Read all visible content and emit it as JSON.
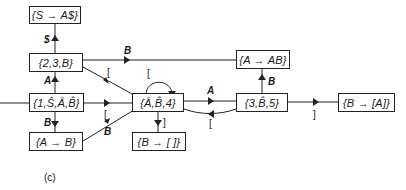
{
  "diagram": {
    "caption": "(c)",
    "nodes": [
      {
        "id": "n_top",
        "label": "{S → A$}"
      },
      {
        "id": "n_23b",
        "label": "{2,3,B}"
      },
      {
        "id": "n_start",
        "label": "{1,Ŝ,Â,B̂}"
      },
      {
        "id": "n_ab_left",
        "label": "{A → B}"
      },
      {
        "id": "n_a4",
        "label": "{Â,B̂,4}"
      },
      {
        "id": "n_b_empty",
        "label": "{B → [ ]}"
      },
      {
        "id": "n_aab",
        "label": "{A → AB}"
      },
      {
        "id": "n_3b5",
        "label": "{3,B̂,5}"
      },
      {
        "id": "n_ba",
        "label": "{B → [A]}"
      }
    ],
    "edges": [
      {
        "from": "n_23b",
        "to": "n_top",
        "label": "$"
      },
      {
        "from": "n_start",
        "to": "n_23b",
        "label": "A"
      },
      {
        "from": "n_start",
        "to": "n_ab_left",
        "label": "B"
      },
      {
        "from": "n_start",
        "to": "n_a4",
        "label": "["
      },
      {
        "from": "n_23b",
        "to": "n_a4",
        "label": "["
      },
      {
        "from": "n_ab_left",
        "to": "n_a4",
        "label": "B"
      },
      {
        "from": "n_a4",
        "to": "n_a4",
        "label": "["
      },
      {
        "from": "n_a4",
        "to": "n_b_empty",
        "label": "]"
      },
      {
        "from": "n_a4",
        "to": "n_3b5",
        "label": "A"
      },
      {
        "from": "n_3b5",
        "to": "n_a4",
        "label": "["
      },
      {
        "from": "n_23b",
        "to": "n_aab",
        "label": "B"
      },
      {
        "from": "n_3b5",
        "to": "n_aab",
        "label": "B"
      },
      {
        "from": "n_3b5",
        "to": "n_ba",
        "label": "]"
      },
      {
        "from": "entry",
        "to": "n_start",
        "label": ""
      }
    ]
  }
}
